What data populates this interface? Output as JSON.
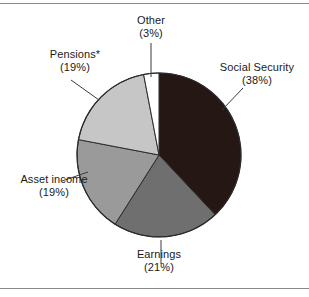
{
  "figure": {
    "title": "",
    "footnote_marker": "*"
  },
  "chart_data": {
    "type": "pie",
    "title": "",
    "xlabel": "",
    "ylabel": "",
    "legend_position": "none",
    "grid": false,
    "start_angle_deg": 0,
    "direction": "clockwise",
    "categories": [
      "Social Security",
      "Earnings",
      "Asset income",
      "Pensions*",
      "Other"
    ],
    "values": [
      38,
      21,
      19,
      19,
      3
    ],
    "value_unit": "percent",
    "colors": [
      "#251714",
      "#6f6f6f",
      "#9a9a9a",
      "#c6c6c6",
      "#ffffff"
    ],
    "slices": [
      {
        "name": "Social Security",
        "value": 38,
        "label": "Social Security",
        "percent_text": "(38%)",
        "color": "#251714"
      },
      {
        "name": "Earnings",
        "value": 21,
        "label": "Earnings",
        "percent_text": "(21%)",
        "color": "#6f6f6f"
      },
      {
        "name": "Asset income",
        "value": 19,
        "label": "Asset income",
        "percent_text": "(19%)",
        "color": "#9a9a9a"
      },
      {
        "name": "Pensions*",
        "value": 19,
        "label": "Pensions*",
        "percent_text": "(19%)",
        "color": "#c6c6c6"
      },
      {
        "name": "Other",
        "value": 3,
        "label": "Other",
        "percent_text": "(3%)",
        "color": "#ffffff"
      }
    ]
  },
  "labels": {
    "other": {
      "name": "Other",
      "percent": "(3%)"
    },
    "social": {
      "name": "Social Security",
      "percent": "(38%)"
    },
    "pensions": {
      "name": "Pensions*",
      "percent": "(19%)"
    },
    "asset": {
      "name": "Asset income",
      "percent": "(19%)"
    },
    "earnings": {
      "name": "Earnings",
      "percent": "(21%)"
    }
  },
  "colors": {
    "slice_social_security": "#251714",
    "slice_earnings": "#6f6f6f",
    "slice_asset_income": "#9a9a9a",
    "slice_pensions": "#c6c6c6",
    "slice_other": "#ffffff",
    "outline": "#2b2b2b",
    "leader_line": "#3a3a3a",
    "frame_rule": "#8a8a8a",
    "text": "#1a1a1a"
  }
}
